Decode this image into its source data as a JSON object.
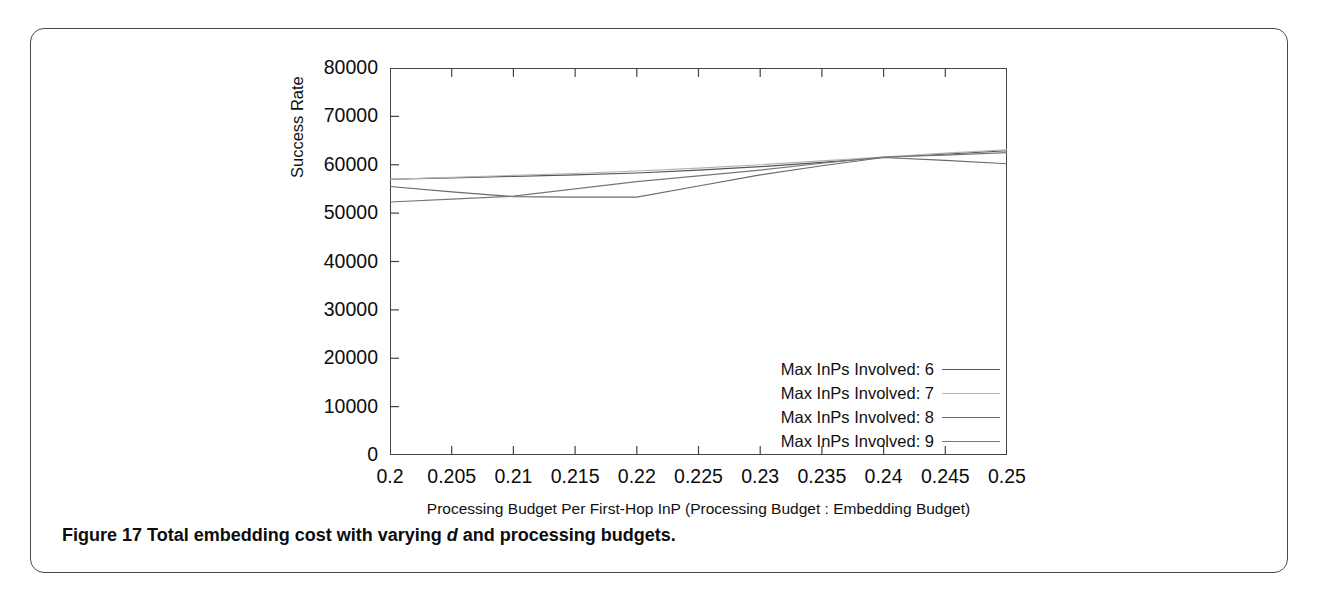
{
  "figure": {
    "caption_label": "Figure 17",
    "caption_text_before": "Total embedding cost with varying",
    "caption_italic": "d",
    "caption_text_after": "and processing budgets."
  },
  "chart_data": {
    "type": "line",
    "title": "",
    "xlabel": "Processing Budget Per First-Hop InP (Processing Budget : Embedding Budget)",
    "ylabel": "Success Rate",
    "xlim": [
      0.2,
      0.25
    ],
    "ylim": [
      0,
      80000
    ],
    "xticks": [
      0.2,
      0.205,
      0.21,
      0.215,
      0.22,
      0.225,
      0.23,
      0.235,
      0.24,
      0.245,
      0.25
    ],
    "xtick_labels": [
      "0.2",
      "0.205",
      "0.21",
      "0.215",
      "0.22",
      "0.225",
      "0.23",
      "0.235",
      "0.24",
      "0.245",
      "0.25"
    ],
    "yticks": [
      0,
      10000,
      20000,
      30000,
      40000,
      50000,
      60000,
      70000,
      80000
    ],
    "ytick_labels": [
      "0",
      "10000",
      "20000",
      "30000",
      "40000",
      "50000",
      "60000",
      "70000",
      "80000"
    ],
    "grid": false,
    "legend_position": "lower right",
    "x": [
      0.2,
      0.205,
      0.21,
      0.215,
      0.22,
      0.225,
      0.23,
      0.235,
      0.24,
      0.245,
      0.25
    ],
    "series": [
      {
        "name": "Max InPs Involved: 6",
        "color": "#555555",
        "values": [
          57000,
          57300,
          57600,
          57900,
          58300,
          58900,
          59600,
          60500,
          61500,
          62200,
          62900
        ]
      },
      {
        "name": "Max InPs Involved: 7",
        "color": "#b4b4b4",
        "values": [
          57000,
          57400,
          57800,
          58200,
          58700,
          59300,
          60000,
          60800,
          61600,
          62400,
          63100
        ]
      },
      {
        "name": "Max InPs Involved: 8",
        "color": "#6a6a6a",
        "values": [
          55500,
          54400,
          53400,
          53300,
          53300,
          55600,
          57900,
          59800,
          61500,
          60900,
          60200
        ]
      },
      {
        "name": "Max InPs Involved: 9",
        "color": "#777777",
        "values": [
          52300,
          52900,
          53500,
          55000,
          56500,
          57700,
          58900,
          60300,
          61600,
          62000,
          62500
        ]
      }
    ],
    "legend_entries": [
      "Max InPs Involved: 6",
      "Max InPs Involved: 7",
      "Max InPs Involved: 8",
      "Max InPs Involved: 9"
    ]
  }
}
